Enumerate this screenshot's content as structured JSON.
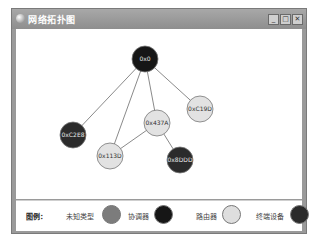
{
  "window": {
    "title": "网络拓扑图",
    "buttons": {
      "minimize": "_",
      "maximize": "□",
      "close": "✕"
    }
  },
  "topology": {
    "nodes": [
      {
        "id": "0x0",
        "label": "0x0",
        "type": "coordinator",
        "x": 129,
        "y": 30
      },
      {
        "id": "0xC2E8",
        "label": "0xC2E8",
        "type": "end_device",
        "x": 57,
        "y": 106
      },
      {
        "id": "0x437A",
        "label": "0x437A",
        "type": "router",
        "x": 141,
        "y": 94
      },
      {
        "id": "0xC19D",
        "label": "0xC19D",
        "type": "router",
        "x": 184,
        "y": 80
      },
      {
        "id": "0x113D",
        "label": "0x113D",
        "type": "router",
        "x": 94,
        "y": 127
      },
      {
        "id": "0x8DDD",
        "label": "0x8DDD",
        "type": "end_device",
        "x": 164,
        "y": 131
      }
    ],
    "edges": [
      [
        "0x0",
        "0xC2E8"
      ],
      [
        "0x0",
        "0x113D"
      ],
      [
        "0x0",
        "0x437A"
      ],
      [
        "0x0",
        "0xC19D"
      ],
      [
        "0x437A",
        "0x113D"
      ],
      [
        "0x437A",
        "0x8DDD"
      ]
    ]
  },
  "legend": {
    "title": "图例：",
    "items": [
      {
        "label": "未知类型",
        "type": "unknown",
        "color": "#7c7c7c"
      },
      {
        "label": "协调器",
        "type": "coordinator",
        "color": "#161616"
      },
      {
        "label": "路由器",
        "type": "router",
        "color": "#dedede"
      },
      {
        "label": "终端设备",
        "type": "end_device",
        "color": "#2b2b2b"
      }
    ]
  },
  "colors": {
    "coordinator": "#161616",
    "router": "#e2e2e2",
    "end_device": "#2b2b2b",
    "unknown": "#7c7c7c",
    "edge": "#8a8a8a"
  }
}
